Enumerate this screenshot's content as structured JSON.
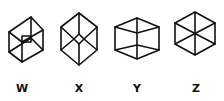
{
  "figures": [
    {
      "id": "W",
      "label": "W",
      "description": "rectangular box viewed with small inner rectangle face",
      "label_x": 22
    },
    {
      "id": "X",
      "label": "X",
      "description": "elongated hexagon with small central diamond and spokes",
      "label_x": 79
    },
    {
      "id": "Y",
      "label": "Y",
      "description": "wide box seen from above with central vertical edge",
      "label_x": 137
    },
    {
      "id": "Z",
      "label": "Z",
      "description": "regular hexagon with three diagonals through center",
      "label_x": 196
    }
  ],
  "colors": {
    "stroke": "#111111",
    "background": "#ffffff"
  }
}
